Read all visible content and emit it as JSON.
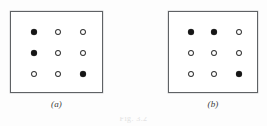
{
  "figure": {
    "background_color": "#fdfdfd",
    "border_color": "#5f6265",
    "filled_marker_color": "#161616",
    "open_marker_color": "#ffffff",
    "open_marker_border_color": "#2c2c2c",
    "bottom_label": "Fig. 3.2",
    "panels": [
      {
        "id": "a",
        "caption": "(a)",
        "grid_rows": 3,
        "grid_cols": 3,
        "markers": [
          [
            "filled",
            "open",
            "open"
          ],
          [
            "filled",
            "open",
            "open"
          ],
          [
            "open",
            "open",
            "filled"
          ]
        ]
      },
      {
        "id": "b",
        "caption": "(b)",
        "grid_rows": 3,
        "grid_cols": 3,
        "markers": [
          [
            "filled",
            "filled",
            "open"
          ],
          [
            "open",
            "open",
            "open"
          ],
          [
            "open",
            "open",
            "filled"
          ]
        ]
      }
    ]
  }
}
